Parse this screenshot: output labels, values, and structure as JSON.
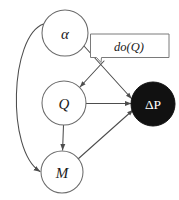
{
  "figure": {
    "kind": "causal-diagram",
    "background_color": "#ffffff",
    "stroke_color": "#6b6b6b",
    "filled_node_color": "#111111",
    "filled_node_text_color": "#ffffff"
  },
  "nodes": {
    "alpha": {
      "label": "α",
      "name": "alpha",
      "style": "open",
      "cx": 65,
      "cy": 33,
      "r": 23
    },
    "q": {
      "label": "Q",
      "name": "Q",
      "style": "open",
      "cx": 64,
      "cy": 103,
      "r": 22
    },
    "m": {
      "label": "M",
      "name": "M",
      "style": "open",
      "cx": 62,
      "cy": 172,
      "r": 21
    },
    "deltap": {
      "label": "ΔP",
      "name": "Delta P",
      "style": "filled",
      "cx": 153,
      "cy": 104,
      "r": 22
    }
  },
  "callout": {
    "label": "do(Q)",
    "x": 98,
    "y": 33
  },
  "edges": [
    {
      "name": "alpha-to-deltaP",
      "from": "alpha",
      "to": "deltap",
      "arrow": true
    },
    {
      "name": "alpha-to-M",
      "from": "alpha",
      "to": "m",
      "arrow": true,
      "curved": true
    },
    {
      "name": "do-intervention-to-Q",
      "from": "do(Q)",
      "to": "Q",
      "arrow": true
    },
    {
      "name": "Q-to-deltaP",
      "from": "Q",
      "to": "deltap",
      "arrow": true
    },
    {
      "name": "Q-to-M",
      "from": "Q",
      "to": "M",
      "arrow": true
    },
    {
      "name": "M-to-deltaP",
      "from": "M",
      "to": "deltap",
      "arrow": true
    }
  ]
}
